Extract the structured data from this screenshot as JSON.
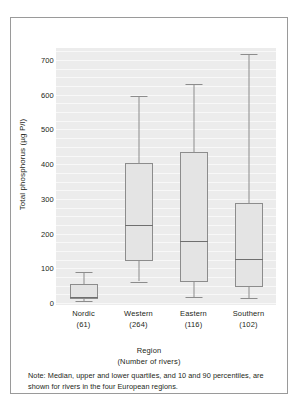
{
  "chart_data": {
    "type": "box",
    "title": "",
    "xlabel": "Region",
    "xlabel_sub": "(Number of rivers)",
    "ylabel": "Total phosphorus (µg P/l)",
    "ylim": [
      0,
      740
    ],
    "yticks": [
      0,
      100,
      200,
      300,
      400,
      500,
      600,
      700
    ],
    "ytick_labels": [
      "0",
      "100",
      "200",
      "300",
      "400",
      "500",
      "600",
      "700"
    ],
    "grid": "horizontal-minor-white",
    "legend": "none",
    "categories": [
      "Nordic",
      "Western",
      "Eastern",
      "Southern"
    ],
    "category_counts": [
      "(61)",
      "(264)",
      "(116)",
      "(102)"
    ],
    "boxes": [
      {
        "name": "Nordic",
        "count": 61,
        "p10": 6,
        "q1": 12,
        "median": 18,
        "q3": 55,
        "p90": 90
      },
      {
        "name": "Western",
        "count": 264,
        "p10": 62,
        "q1": 120,
        "median": 225,
        "q3": 402,
        "p90": 595
      },
      {
        "name": "Eastern",
        "count": 116,
        "p10": 18,
        "q1": 62,
        "median": 180,
        "q3": 435,
        "p90": 630
      },
      {
        "name": "Southern",
        "count": 102,
        "p10": 15,
        "q1": 46,
        "median": 128,
        "q3": 288,
        "p90": 718
      }
    ]
  },
  "note": {
    "text": "Note: Median, upper and lower quartiles, and 10 and 90 percentiles, are shown for rivers in the four European regions."
  },
  "colors": {
    "plot_background": "#ececec",
    "gridline": "#f8f8f8",
    "box_fill": "#e4e4e4",
    "box_stroke": "#8c8c8c",
    "text": "#231f20",
    "frame": "#9a9a9a"
  }
}
